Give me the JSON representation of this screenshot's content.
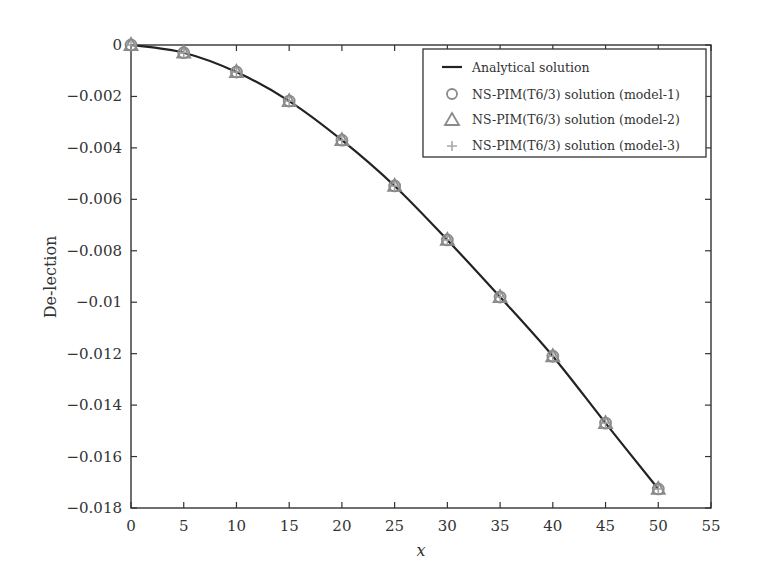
{
  "chart_data": {
    "type": "line",
    "title": "",
    "xlabel": "x",
    "ylabel": "De-lection",
    "xlim": [
      0,
      55
    ],
    "ylim": [
      -0.018,
      0
    ],
    "xticks": [
      0,
      5,
      10,
      15,
      20,
      25,
      30,
      35,
      40,
      45,
      50,
      55
    ],
    "xtick_labels": [
      "0",
      "5",
      "10",
      "15",
      "20",
      "25",
      "30",
      "35",
      "40",
      "45",
      "50",
      "55"
    ],
    "yticks": [
      0,
      -0.002,
      -0.004,
      -0.006,
      -0.008,
      -0.01,
      -0.012,
      -0.014,
      -0.016,
      -0.018
    ],
    "ytick_labels": [
      "0",
      "−0.002",
      "−0.004",
      "−0.006",
      "−0.008",
      "−0.01",
      "−0.012",
      "−0.014",
      "−0.016",
      "−0.018"
    ],
    "grid": false,
    "legend_position": "upper right",
    "x": [
      0,
      5,
      10,
      15,
      20,
      25,
      30,
      35,
      40,
      45,
      50
    ],
    "series": [
      {
        "name": "Analytical solution",
        "style": "line",
        "color": "#222222",
        "values": [
          0,
          -0.0003,
          -0.00105,
          -0.00218,
          -0.0037,
          -0.00548,
          -0.00758,
          -0.0098,
          -0.0121,
          -0.0147,
          -0.01726
        ]
      },
      {
        "name": "NS-PIM(T6/3) solution (model-1)",
        "style": "circle",
        "color": "#8a8a8a",
        "values": [
          0,
          -0.0003,
          -0.00105,
          -0.00218,
          -0.0037,
          -0.00548,
          -0.00758,
          -0.0098,
          -0.0121,
          -0.0147,
          -0.01726
        ]
      },
      {
        "name": "NS-PIM(T6/3) solution (model-2)",
        "style": "triangle",
        "color": "#8a8a8a",
        "values": [
          0,
          -0.0003,
          -0.00105,
          -0.00218,
          -0.0037,
          -0.00548,
          -0.00758,
          -0.0098,
          -0.0121,
          -0.0147,
          -0.01726
        ]
      },
      {
        "name": "NS-PIM(T6/3) solution (model-3)",
        "style": "plus",
        "color": "#a0a0a0",
        "values": [
          0,
          -0.0003,
          -0.00105,
          -0.00218,
          -0.0037,
          -0.00548,
          -0.00758,
          -0.0098,
          -0.0121,
          -0.0147,
          -0.01726
        ]
      }
    ]
  },
  "legend": {
    "items": [
      {
        "label": "Analytical solution",
        "icon": "line-icon"
      },
      {
        "label": "NS-PIM(T6/3) solution (model-1)",
        "icon": "circle-icon"
      },
      {
        "label": "NS-PIM(T6/3) solution (model-2)",
        "icon": "triangle-icon"
      },
      {
        "label": "NS-PIM(T6/3) solution (model-3)",
        "icon": "plus-icon"
      }
    ]
  }
}
